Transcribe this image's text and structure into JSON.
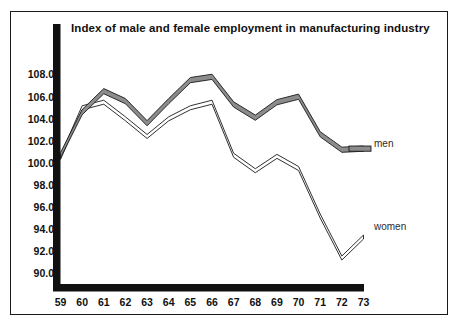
{
  "chart_data": {
    "type": "line",
    "title": "Index of male and female employment in manufacturing industry",
    "xlabel": "",
    "ylabel": "",
    "categories": [
      "59",
      "60",
      "61",
      "62",
      "63",
      "64",
      "65",
      "66",
      "67",
      "68",
      "69",
      "70",
      "71",
      "72",
      "73"
    ],
    "x_tick_labels": [
      "59",
      "60",
      "61",
      "62",
      "63",
      "64",
      "65",
      "66",
      "67",
      "68",
      "69",
      "70",
      "71",
      "72",
      "73"
    ],
    "y_tick_labels": [
      "108.0",
      "106.0",
      "104.0",
      "102.0",
      "100.0",
      "98.0",
      "96.0",
      "94.0",
      "92.0",
      "90.0"
    ],
    "y_ticks": [
      108.0,
      106.0,
      104.0,
      102.0,
      100.0,
      98.0,
      96.0,
      94.0,
      92.0,
      90.0
    ],
    "ylim": [
      88.6,
      109.6
    ],
    "xlim": [
      "59",
      "73"
    ],
    "grid": false,
    "legend_position": "inline-right",
    "series": [
      {
        "name": "men",
        "label": "men",
        "style": "thick-grey-band",
        "color": "#8c8c8c",
        "values": [
          100.7,
          104.6,
          106.5,
          105.6,
          103.6,
          105.6,
          107.5,
          107.8,
          105.3,
          104.1,
          105.5,
          106.0,
          102.6,
          101.2,
          101.3
        ]
      },
      {
        "name": "women",
        "label": "women",
        "style": "thin-white-band",
        "color": "#ffffff",
        "values": [
          100.5,
          105.0,
          105.5,
          104.0,
          102.4,
          104.0,
          105.0,
          105.5,
          100.7,
          99.3,
          100.6,
          99.5,
          95.2,
          91.4,
          93.3
        ]
      }
    ]
  },
  "colors": {
    "axis": "#111111",
    "frame": "#1a1a1a",
    "men_band": "#8c8c8c",
    "women_band": "#ffffff",
    "outline": "#1a1a1a",
    "background": "#ffffff"
  }
}
